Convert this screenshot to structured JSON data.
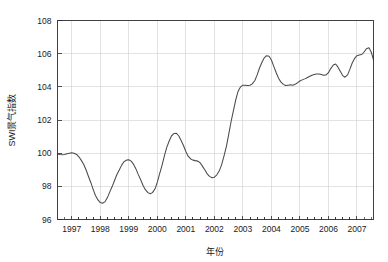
{
  "chart_data": {
    "type": "line",
    "title": "",
    "xlabel": "年份",
    "ylabel": "SWI景气指数",
    "xlim": [
      1996.5,
      2007.58
    ],
    "ylim": [
      96,
      108
    ],
    "grid": true,
    "legend": false,
    "y_ticks": [
      96,
      98,
      100,
      102,
      104,
      106,
      108
    ],
    "x_ticks": [
      1997,
      1998,
      1999,
      2000,
      2001,
      2002,
      2003,
      2004,
      2005,
      2006,
      2007
    ],
    "x_minor_ticks_per_interval": 3,
    "line_color": "#4a4a4a",
    "grid_color": "#cfcfcf",
    "axis_color": "#2b2b2b",
    "series": [
      {
        "name": "SWI景气指数",
        "x": [
          1996.5,
          1996.58,
          1996.67,
          1996.75,
          1996.83,
          1996.92,
          1997.0,
          1997.08,
          1997.17,
          1997.25,
          1997.33,
          1997.42,
          1997.5,
          1997.58,
          1997.67,
          1997.75,
          1997.83,
          1997.92,
          1998.0,
          1998.08,
          1998.17,
          1998.25,
          1998.33,
          1998.42,
          1998.5,
          1998.58,
          1998.67,
          1998.75,
          1998.83,
          1998.92,
          1999.0,
          1999.08,
          1999.17,
          1999.25,
          1999.33,
          1999.42,
          1999.5,
          1999.58,
          1999.67,
          1999.75,
          1999.83,
          1999.92,
          2000.0,
          2000.08,
          2000.17,
          2000.25,
          2000.33,
          2000.42,
          2000.5,
          2000.58,
          2000.67,
          2000.75,
          2000.83,
          2000.92,
          2001.0,
          2001.08,
          2001.17,
          2001.25,
          2001.33,
          2001.42,
          2001.5,
          2001.58,
          2001.67,
          2001.75,
          2001.83,
          2001.92,
          2002.0,
          2002.08,
          2002.17,
          2002.25,
          2002.33,
          2002.42,
          2002.5,
          2002.58,
          2002.67,
          2002.75,
          2002.83,
          2002.92,
          2003.0,
          2003.08,
          2003.17,
          2003.25,
          2003.33,
          2003.42,
          2003.5,
          2003.58,
          2003.67,
          2003.75,
          2003.83,
          2003.92,
          2004.0,
          2004.08,
          2004.17,
          2004.25,
          2004.33,
          2004.42,
          2004.5,
          2004.58,
          2004.67,
          2004.75,
          2004.83,
          2004.92,
          2005.0,
          2005.08,
          2005.17,
          2005.25,
          2005.33,
          2005.42,
          2005.5,
          2005.58,
          2005.67,
          2005.75,
          2005.83,
          2005.92,
          2006.0,
          2006.08,
          2006.17,
          2006.25,
          2006.33,
          2006.42,
          2006.5,
          2006.58,
          2006.67,
          2006.75,
          2006.83,
          2006.92,
          2007.0,
          2007.08,
          2007.17,
          2007.25,
          2007.33,
          2007.42,
          2007.5,
          2007.58
        ],
        "y": [
          99.95,
          99.92,
          99.9,
          99.92,
          99.96,
          100.0,
          100.02,
          100.0,
          99.92,
          99.78,
          99.58,
          99.32,
          99.0,
          98.62,
          98.22,
          97.82,
          97.45,
          97.18,
          97.02,
          96.98,
          97.08,
          97.32,
          97.65,
          98.0,
          98.35,
          98.7,
          99.0,
          99.28,
          99.48,
          99.58,
          99.6,
          99.52,
          99.32,
          99.05,
          98.72,
          98.38,
          98.05,
          97.8,
          97.62,
          97.55,
          97.62,
          97.85,
          98.25,
          98.75,
          99.3,
          99.85,
          100.35,
          100.75,
          101.05,
          101.18,
          101.2,
          101.05,
          100.78,
          100.45,
          100.1,
          99.82,
          99.65,
          99.58,
          99.55,
          99.52,
          99.42,
          99.22,
          98.98,
          98.75,
          98.6,
          98.52,
          98.55,
          98.68,
          98.92,
          99.28,
          99.78,
          100.4,
          101.1,
          101.85,
          102.58,
          103.22,
          103.72,
          104.0,
          104.1,
          104.1,
          104.08,
          104.1,
          104.18,
          104.38,
          104.72,
          105.12,
          105.48,
          105.75,
          105.88,
          105.85,
          105.62,
          105.25,
          104.85,
          104.52,
          104.3,
          104.15,
          104.08,
          104.1,
          104.12,
          104.1,
          104.15,
          104.25,
          104.35,
          104.42,
          104.48,
          104.55,
          104.62,
          104.7,
          104.75,
          104.78,
          104.78,
          104.75,
          104.7,
          104.72,
          104.85,
          105.1,
          105.32,
          105.38,
          105.2,
          104.92,
          104.68,
          104.58,
          104.72,
          105.05,
          105.42,
          105.72,
          105.88,
          105.92,
          105.95,
          106.1,
          106.3,
          106.35,
          106.1,
          105.62
        ]
      }
    ]
  },
  "figure": {
    "background_color": "#ffffff"
  }
}
